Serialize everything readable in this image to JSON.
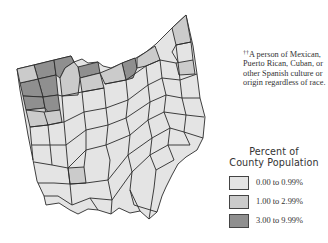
{
  "footnote": {
    "marker": "††",
    "text": "A person of Mexican, Puerto Rican, Cuban, or other Spanish culture or origin regardless of race."
  },
  "legend": {
    "title_line1": "Percent of",
    "title_line2": "County Population",
    "items": [
      {
        "label": "0.00 to 0.99%",
        "color": "#e4e4e4"
      },
      {
        "label": "1.00 to 2.99%",
        "color": "#cbcbcb"
      },
      {
        "label": "3.00 to 9.99%",
        "color": "#8f8f8f"
      }
    ]
  },
  "map": {
    "region": "Ohio counties",
    "border_color": "#2a2a2a",
    "class_colors": {
      "low": "#e4e4e4",
      "mid": "#cbcbcb",
      "high": "#8f8f8f"
    }
  }
}
